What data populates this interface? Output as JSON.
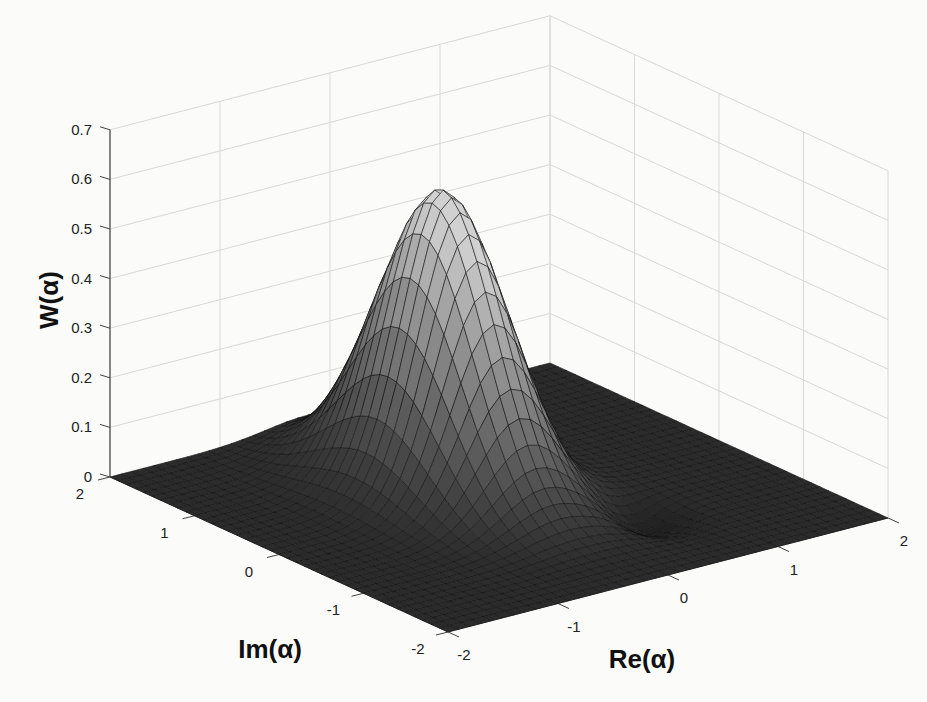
{
  "chart_data": {
    "type": "surface",
    "title": "",
    "xlabel": "Re(α)",
    "ylabel": "Im(α)",
    "zlabel": "W(α)",
    "xlim": [
      -2,
      2
    ],
    "ylim": [
      -2,
      2
    ],
    "zlim": [
      0,
      0.7
    ],
    "x_ticks": [
      "-2",
      "-1",
      "0",
      "1",
      "2"
    ],
    "y_ticks": [
      "-2",
      "-1",
      "0",
      "1",
      "2"
    ],
    "z_ticks": [
      "0",
      "0.1",
      "0.2",
      "0.3",
      "0.4",
      "0.5",
      "0.6",
      "0.7"
    ],
    "grid": true,
    "peak": {
      "re": -0.2,
      "im": 0.4,
      "value": 0.6
    },
    "surface_description": "Wigner quasi-probability distribution: single dominant Gaussian-like peak (~0.6) near origin, slightly elongated along Im axis, with shallow negative dip near Re≈0.6, Im≈-0.9; near zero elsewhere",
    "colormap": "grayscale",
    "colors": {
      "surface_low": "#2a2a2a",
      "surface_high": "#c8c8c8",
      "grid": "#d8d8d8",
      "axis": "#444444",
      "mesh": "#111111"
    }
  },
  "axes": {
    "z_label": "W(α)",
    "x_label": "Re(α)",
    "y_label": "Im(α)"
  }
}
